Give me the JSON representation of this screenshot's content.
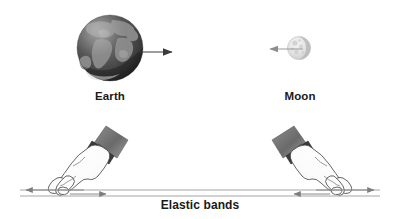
{
  "figure": {
    "background_color": "#ffffff",
    "labels": {
      "earth": "Earth",
      "moon": "Moon",
      "elastic_bands": "Elastic bands"
    },
    "bodies": [
      {
        "name": "earth",
        "label": "Earth",
        "center_x": 110,
        "center_y": 48,
        "radius": 33,
        "color": "#4a4a4a",
        "arrow": {
          "name": "earth-force-arrow",
          "direction": "right",
          "from_x": 139,
          "to_x": 176,
          "y": 52,
          "color": "#3c3c3c"
        }
      },
      {
        "name": "moon",
        "label": "Moon",
        "center_x": 299,
        "center_y": 48,
        "radius": 11,
        "color": "#dcdcdc",
        "arrow": {
          "name": "moon-force-arrow",
          "direction": "left",
          "from_x": 301,
          "to_x": 266,
          "y": 49,
          "color": "#9a9a9a"
        }
      }
    ],
    "hands": [
      {
        "name": "left-hand",
        "side": "left",
        "wrist_x": 100,
        "wrist_y": 133,
        "finger_x": 62,
        "finger_y": 193,
        "skin_color": "#fdfdfd",
        "outline_color": "#4a4a4a",
        "sleeve_color": "#6e6e6e",
        "watch_color": "#3a3a3a"
      },
      {
        "name": "right-hand",
        "side": "right",
        "wrist_x": 300,
        "wrist_y": 133,
        "finger_x": 338,
        "finger_y": 193,
        "skin_color": "#fdfdfd",
        "outline_color": "#4a4a4a",
        "sleeve_color": "#6e6e6e",
        "watch_color": "#3a3a3a"
      }
    ],
    "bands": [
      {
        "name": "upper-band-line",
        "y": 190,
        "x1": 20,
        "x2": 380,
        "color": "#8a8a8a",
        "arrowheads": [
          "left-end",
          "right-end"
        ]
      },
      {
        "name": "lower-band-line",
        "y": 196,
        "x1": 20,
        "x2": 380,
        "color": "#8a8a8a",
        "arrowheads": [
          "inward-left",
          "inward-right"
        ]
      }
    ],
    "band_arrows": [
      {
        "name": "outer-left-arrow",
        "direction": "left",
        "tip_x": 22,
        "tail_x": 82,
        "y": 190
      },
      {
        "name": "outer-right-arrow",
        "direction": "right",
        "tip_x": 378,
        "tail_x": 318,
        "y": 190
      },
      {
        "name": "inner-left-arrow",
        "direction": "right",
        "tip_x": 110,
        "tail_x": 72,
        "y": 194
      },
      {
        "name": "inner-right-arrow",
        "direction": "left",
        "tip_x": 290,
        "tail_x": 328,
        "y": 194
      }
    ]
  }
}
